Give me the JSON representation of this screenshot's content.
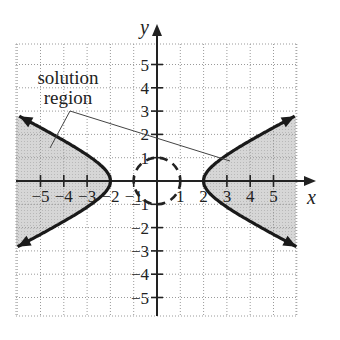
{
  "chart_data": {
    "type": "line",
    "title": "",
    "xlabel": "x",
    "ylabel": "y",
    "xlim": [
      -6,
      6
    ],
    "ylim": [
      -6,
      6
    ],
    "grid": true,
    "x_ticks": [
      -5,
      -4,
      -3,
      -2,
      -1,
      1,
      2,
      3,
      4,
      5
    ],
    "y_ticks": [
      -5,
      -4,
      -3,
      -2,
      -1,
      1,
      2,
      3,
      4,
      5
    ],
    "x_tick_labels": [
      "−5",
      "−4",
      "−3",
      "−2",
      "−1",
      "1",
      "2",
      "3",
      "4",
      "5"
    ],
    "y_tick_labels": [
      "−5",
      "−4",
      "−3",
      "−2",
      "−1",
      "1",
      "2",
      "3",
      "4",
      "5"
    ],
    "series": [
      {
        "name": "hyperbola (solid boundary)",
        "equation": "x^2/4 - y^2 = 1",
        "style": "solid",
        "vertices": [
          [
            -2,
            0
          ],
          [
            2,
            0
          ]
        ],
        "shaded": "outside branches (x^2/4 - y^2 >= 1)"
      },
      {
        "name": "circle (dashed boundary)",
        "equation": "x^2 + y^2 = 1",
        "style": "dashed",
        "center": [
          0,
          0
        ],
        "radius": 1
      }
    ],
    "annotations": [
      {
        "text": "solution region",
        "points_to": [
          [
            -5.4,
            1.2
          ],
          [
            3.3,
            1.1
          ]
        ]
      }
    ],
    "shading_color": "#d4d4d4"
  },
  "labels": {
    "axis_x": "x",
    "axis_y": "y",
    "annotation_line1": "solution",
    "annotation_line2": "region",
    "x_ticks": [
      "−5",
      "−4",
      "−3",
      "−2",
      "−1",
      "1",
      "2",
      "3",
      "4",
      "5"
    ],
    "y_ticks": [
      "5",
      "4",
      "3",
      "2",
      "1",
      "−1",
      "−2",
      "−3",
      "−4",
      "−5"
    ]
  }
}
